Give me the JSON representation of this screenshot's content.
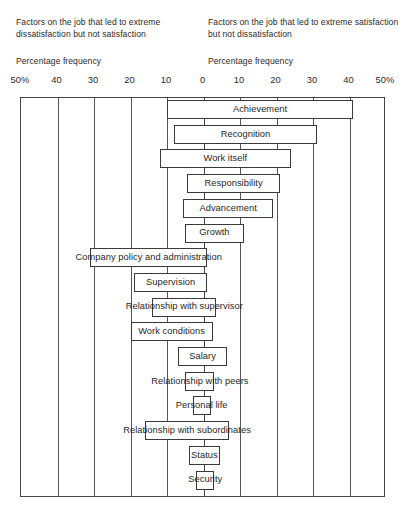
{
  "headers": {
    "left_caption": "Factors on the job that led to extreme dissatisfaction but not satisfaction",
    "right_caption": "Factors on the job that led to extreme satisfaction but not dissatisfaction",
    "left_axis_title": "Percentage frequency",
    "right_axis_title": "Percentage frequency"
  },
  "axis": {
    "tick_labels": [
      "50%",
      "40",
      "30",
      "20",
      "10",
      "0",
      "10",
      "20",
      "30",
      "40",
      "50%"
    ],
    "tick_positions_pct": [
      -50,
      -40,
      -30,
      -20,
      -10,
      0,
      10,
      20,
      30,
      40,
      50
    ]
  },
  "chart_data": {
    "type": "bar",
    "orientation": "horizontal-diverging",
    "xlabel": "Percentage frequency",
    "ylabel": "",
    "xlim": [
      -50,
      50
    ],
    "grid": true,
    "legend": "none",
    "left_axis_label": "Factors on the job that led to extreme dissatisfaction but not satisfaction",
    "right_axis_label": "Factors on the job that led to extreme satisfaction but not dissatisfaction",
    "categories": [
      "Achievement",
      "Recognition",
      "Work itself",
      "Responsibility",
      "Advancement",
      "Growth",
      "Company policy and administration",
      "Supervision",
      "Relationship with supervisor",
      "Work conditions",
      "Salary",
      "Relationship with peers",
      "Personal life",
      "Relationship with subordinates",
      "Status",
      "Security"
    ],
    "series": [
      {
        "name": "Dissatisfaction (left, %)",
        "values": [
          10,
          8,
          12,
          4.5,
          5.5,
          5,
          31,
          19,
          14,
          20,
          7,
          5,
          3,
          16,
          4,
          2
        ]
      },
      {
        "name": "Satisfaction (right, %)",
        "values": [
          41,
          31,
          24,
          21,
          19,
          11,
          1,
          1,
          3.5,
          2.5,
          6.5,
          3,
          2,
          7,
          4.5,
          3
        ]
      }
    ],
    "bars": [
      {
        "label": "Achievement",
        "start_pct": -10,
        "end_pct": 41
      },
      {
        "label": "Recognition",
        "start_pct": -8,
        "end_pct": 31
      },
      {
        "label": "Work itself",
        "start_pct": -12,
        "end_pct": 24
      },
      {
        "label": "Responsibility",
        "start_pct": -4.5,
        "end_pct": 21
      },
      {
        "label": "Advancement",
        "start_pct": -5.5,
        "end_pct": 19
      },
      {
        "label": "Growth",
        "start_pct": -5,
        "end_pct": 11
      },
      {
        "label": "Company policy and administration",
        "start_pct": -31,
        "end_pct": 1
      },
      {
        "label": "Supervision",
        "start_pct": -19,
        "end_pct": 1
      },
      {
        "label": "Relationship with supervisor",
        "start_pct": -14,
        "end_pct": 3.5
      },
      {
        "label": "Work conditions",
        "start_pct": -20,
        "end_pct": 2.5
      },
      {
        "label": "Salary",
        "start_pct": -7,
        "end_pct": 6.5
      },
      {
        "label": "Relationship with peers",
        "start_pct": -5,
        "end_pct": 3
      },
      {
        "label": "Personal life",
        "start_pct": -3,
        "end_pct": 2
      },
      {
        "label": "Relationship with subordinates",
        "start_pct": -16,
        "end_pct": 7
      },
      {
        "label": "Status",
        "start_pct": -4,
        "end_pct": 4.5
      },
      {
        "label": "Security",
        "start_pct": -2,
        "end_pct": 3
      }
    ]
  }
}
